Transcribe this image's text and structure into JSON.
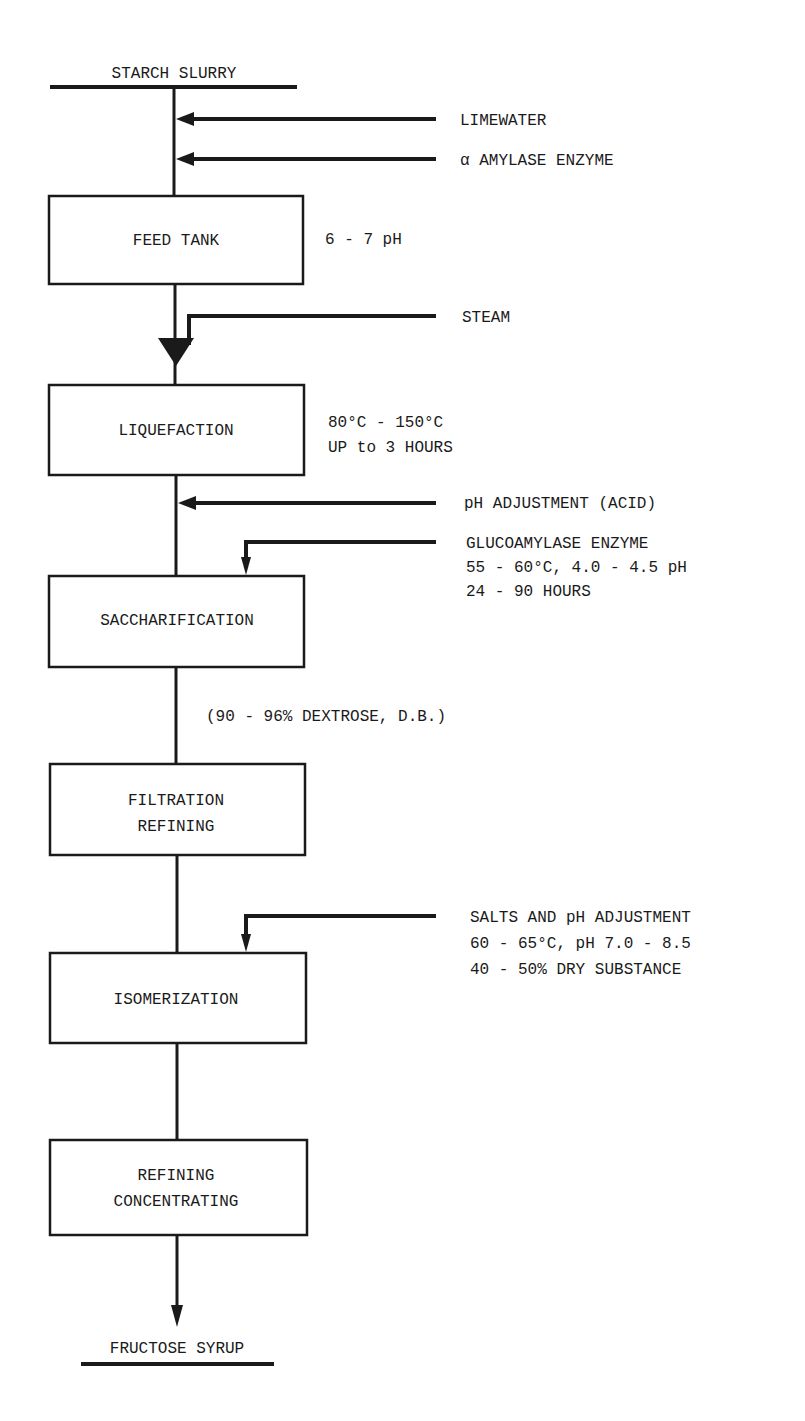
{
  "diagram": {
    "type": "process-flowchart",
    "start": "STARCH SLURRY",
    "end": "FRUCTOSE SYRUP",
    "stages": [
      {
        "label_lines": [
          "FEED TANK"
        ],
        "note_lines": [
          "6 - 7 pH"
        ]
      },
      {
        "label_lines": [
          "LIQUEFACTION"
        ],
        "note_lines": [
          "80°C - 150°C",
          "UP to 3 HOURS"
        ]
      },
      {
        "label_lines": [
          "SACCHARIFICATION"
        ],
        "note_lines": []
      },
      {
        "label_lines": [
          "FILTRATION",
          "REFINING"
        ],
        "note_lines": []
      },
      {
        "label_lines": [
          "ISOMERIZATION"
        ],
        "note_lines": []
      },
      {
        "label_lines": [
          "REFINING",
          "CONCENTRATING"
        ],
        "note_lines": []
      }
    ],
    "inputs": [
      {
        "label": "LIMEWATER",
        "to": "main-line-before-feed-tank"
      },
      {
        "label": "α AMYLASE ENZYME",
        "to": "main-line-before-feed-tank"
      },
      {
        "label": "STEAM",
        "to": "main-line-before-liquefaction"
      },
      {
        "label": "pH ADJUSTMENT (ACID)",
        "to": "main-line-before-saccharification"
      },
      {
        "label_lines": [
          "GLUCOAMYLASE ENZYME",
          "55 - 60°C, 4.0 - 4.5 pH",
          "24 - 90 HOURS"
        ],
        "to": "saccharification"
      },
      {
        "label_lines": [
          "SALTS AND pH ADJUSTMENT",
          "60 - 65°C, pH 7.0 - 8.5",
          "40 - 50% DRY SUBSTANCE"
        ],
        "to": "isomerization"
      }
    ],
    "flow_annotations": [
      "(90 - 96% DEXTROSE, D.B.)"
    ]
  }
}
